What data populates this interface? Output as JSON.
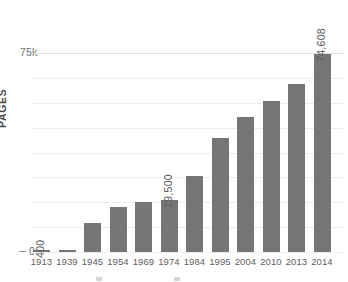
{
  "chart_data": {
    "type": "bar",
    "title": "",
    "xlabel": "",
    "ylabel": "PAGES",
    "categories": [
      "1913",
      "1939",
      "1945",
      "1954",
      "1969",
      "1974",
      "1984",
      "1995",
      "2004",
      "2010",
      "2013",
      "2014"
    ],
    "values": [
      400,
      800,
      11000,
      17000,
      19000,
      19500,
      28500,
      43000,
      51000,
      57000,
      63500,
      74608
    ],
    "value_labels": [
      "400",
      "",
      "",
      "",
      "",
      "19,500",
      "",
      "",
      "",
      "",
      "",
      "74,608"
    ],
    "ylim": [
      0,
      75000
    ],
    "y_ticks": [
      0,
      75000
    ],
    "y_tick_labels": [
      "0",
      "75k"
    ],
    "grid": true,
    "grid_lines": 8,
    "legend": "",
    "legend_position": "bottom",
    "bar_color": "#767676",
    "grid_color": "#ececec",
    "axis_text_color": "#5e5e5e"
  },
  "axis": {
    "y_label": "PAGES",
    "y_top_tick": "75k",
    "y_zero_tick": "0"
  },
  "legend_strip": {
    "item_one": "",
    "item_two": ""
  }
}
